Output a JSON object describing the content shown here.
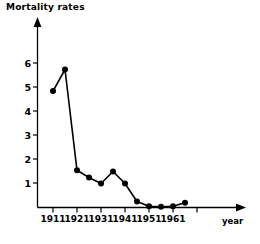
{
  "chart_data": {
    "type": "line",
    "title": "Mortality rates",
    "xlabel": "year",
    "ylabel": "",
    "xlim": [
      1908,
      1973
    ],
    "ylim": [
      0,
      6.6
    ],
    "grid": false,
    "legend": "none",
    "x_tick_labels": [
      "1911",
      "1921",
      "1931",
      "1941",
      "1951",
      "1961"
    ],
    "x_ticks": [
      1911,
      1921,
      1931,
      1941,
      1951,
      1961
    ],
    "y_tick_labels": [
      "1",
      "2",
      "3",
      "4",
      "5",
      "6"
    ],
    "y_ticks": [
      1,
      2,
      3,
      4,
      5,
      6
    ],
    "x": [
      1911,
      1916,
      1921,
      1926,
      1931,
      1936,
      1941,
      1946,
      1951,
      1956,
      1961,
      1966
    ],
    "values": [
      4.85,
      5.75,
      1.55,
      1.25,
      1.0,
      1.5,
      1.0,
      0.25,
      0.05,
      0.03,
      0.05,
      0.2
    ],
    "marker": "filled-circle",
    "line_color": "#000000",
    "marker_color": "#000000"
  },
  "axes": {
    "y_axis_name": "y-axis",
    "x_axis_name": "x-axis",
    "x_axis_label": "year"
  }
}
